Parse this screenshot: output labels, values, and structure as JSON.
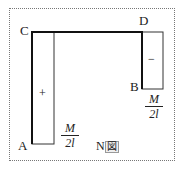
{
  "diagram": {
    "title": "N図",
    "title_main": "N",
    "title_box": "図",
    "points": {
      "A": "A",
      "B": "B",
      "C": "C",
      "D": "D"
    },
    "segments": [
      {
        "name": "AC",
        "from": "A",
        "to": "C",
        "sign": "+",
        "value_num": "M",
        "value_den": "2l"
      },
      {
        "name": "CD",
        "from": "C",
        "to": "D"
      },
      {
        "name": "DB",
        "from": "D",
        "to": "B",
        "sign": "−",
        "value_num": "M",
        "value_den": "2l"
      }
    ],
    "colors": {
      "line": "#222222",
      "border": "#777777"
    }
  }
}
